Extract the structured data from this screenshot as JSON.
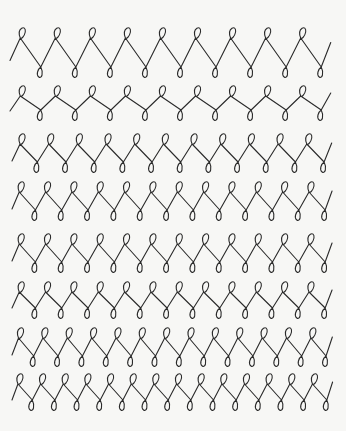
{
  "page": {
    "background": "#f7f7f5",
    "ink_color": "#2a2a2a"
  },
  "rows": [
    {
      "top_y": 30,
      "bottom_y": 75,
      "x_start": 10,
      "x_end": 336,
      "loops": 9
    },
    {
      "top_y": 88,
      "bottom_y": 118,
      "x_start": 10,
      "x_end": 336,
      "loops": 9
    },
    {
      "top_y": 136,
      "bottom_y": 170,
      "x_start": 12,
      "x_end": 336,
      "loops": 11
    },
    {
      "top_y": 184,
      "bottom_y": 218,
      "x_start": 12,
      "x_end": 336,
      "loops": 12
    },
    {
      "top_y": 236,
      "bottom_y": 270,
      "x_start": 12,
      "x_end": 336,
      "loops": 12
    },
    {
      "top_y": 284,
      "bottom_y": 316,
      "x_start": 12,
      "x_end": 336,
      "loops": 12
    },
    {
      "top_y": 330,
      "bottom_y": 364,
      "x_start": 12,
      "x_end": 336,
      "loops": 13
    },
    {
      "top_y": 376,
      "bottom_y": 408,
      "x_start": 12,
      "x_end": 336,
      "loops": 14
    }
  ]
}
